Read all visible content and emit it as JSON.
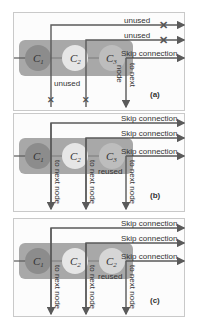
{
  "figure": {
    "colors": {
      "line": "#5a5a5a",
      "block": "#a8a8a8",
      "c1": "#8c8c8c",
      "c2": "#e6e6e6",
      "c3": "#bdbdbd",
      "border": "#c9c9c9"
    },
    "panels": [
      {
        "id": "a",
        "tag": "(a)",
        "cells": [
          {
            "main": "C",
            "sub": "1"
          },
          {
            "main": "C",
            "sub": "2"
          },
          {
            "main": "C",
            "sub": "3"
          }
        ],
        "top_labels": [
          "unused",
          "unused",
          "Skip connection"
        ],
        "bottom_labels": [
          "unused",
          "node",
          "to next"
        ]
      },
      {
        "id": "b",
        "tag": "(b)",
        "cells": [
          {
            "main": "C",
            "sub": "1"
          },
          {
            "main": "C",
            "sub": "2"
          },
          {
            "main": "C",
            "sub": "3"
          }
        ],
        "top_labels": [
          "Skip connection",
          "Skip connection",
          "Skip connection"
        ],
        "vertical_labels": [
          "to next node",
          "to next node",
          "to next node"
        ],
        "reused_label": "reused"
      },
      {
        "id": "c",
        "tag": "(c)",
        "cells": [
          {
            "main": "C",
            "sub": "1"
          },
          {
            "main": "C",
            "sub": "2"
          },
          {
            "main": "C",
            "sub": "2"
          }
        ],
        "top_labels": [
          "Skip connection",
          "Skip connection",
          "Skip connection"
        ],
        "vertical_labels": [
          "to next node",
          "to next node",
          "to next node"
        ],
        "reused_label": "reused"
      }
    ]
  }
}
